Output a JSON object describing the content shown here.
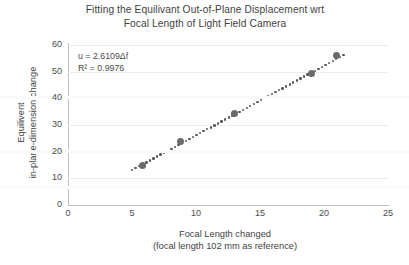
{
  "chart_data": {
    "type": "scatter",
    "title": "Fitting the Equilivant Out-of-Plane Displacement wrt Focal Length of Light Field Camera",
    "title_line1": "Fitting the Equilivant Out-of-Plane Displacement wrt",
    "title_line2": "Focal Length of Light Field Camera",
    "xlabel": "Focal Length changed",
    "xlabel_line2": "(focal length 102 mm as reference)",
    "ylabel": "Equilivent in-plane-dimension change",
    "ylabel_line1": "Equilivent",
    "ylabel_line2": "in-plane-dimension change",
    "xlim": [
      0,
      25
    ],
    "ylim": [
      0,
      60
    ],
    "xticks": [
      0,
      5,
      10,
      15,
      20,
      25
    ],
    "yticks": [
      0,
      10,
      20,
      30,
      40,
      50,
      60
    ],
    "grid": "horizontal",
    "legend": "none",
    "x": [
      5.8,
      8.8,
      13.0,
      19.0,
      21.0
    ],
    "y": [
      15.0,
      24.0,
      34.5,
      49.5,
      56.0
    ],
    "series": [
      {
        "name": "Equilivent in-plane-dimension change",
        "points": [
          {
            "x": 5.8,
            "y": 15.0
          },
          {
            "x": 8.8,
            "y": 24.0
          },
          {
            "x": 13.0,
            "y": 34.5
          },
          {
            "x": 19.0,
            "y": 49.5
          },
          {
            "x": 21.0,
            "y": 56.0
          }
        ]
      }
    ],
    "trendline": {
      "type": "linear-through-origin",
      "style": "dotted",
      "slope": 2.6109,
      "intercept": 0,
      "x_start": 5.0,
      "x_end": 21.6
    },
    "annotations": {
      "equation": "u = 2.6109Δf",
      "r_squared": "R² = 0.9976"
    },
    "colors": {
      "marker": "#6b6b6b",
      "trendline": "#595959",
      "axis": "#bfbfbf",
      "grid": "#ededed",
      "text": "#3f3f3f",
      "background": "#ffffff"
    }
  }
}
